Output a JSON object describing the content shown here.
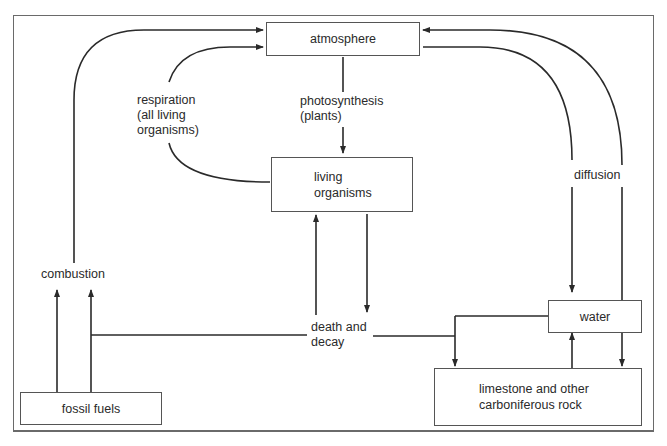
{
  "diagram": {
    "nodes": {
      "atmosphere": "atmosphere",
      "living_organisms": "living\norganisms",
      "water": "water",
      "fossil_fuels": "fossil fuels",
      "limestone": "limestone and other\ncarboniferous rock"
    },
    "process_labels": {
      "respiration": "respiration\n(all living\norganisms)",
      "photosynthesis": "photosynthesis\n(plants)",
      "diffusion": "diffusion",
      "combustion": "combustion",
      "death_decay": "death and\ndecay"
    },
    "edges": [
      {
        "from": "combustion",
        "to": "atmosphere"
      },
      {
        "from": "living organisms",
        "to": "atmosphere",
        "label": "respiration (all living organisms)"
      },
      {
        "from": "atmosphere",
        "to": "living organisms",
        "label": "photosynthesis (plants)"
      },
      {
        "from": "atmosphere",
        "to": "water",
        "label": "diffusion"
      },
      {
        "from": "water",
        "to": "atmosphere",
        "label": "diffusion"
      },
      {
        "from": "fossil fuels",
        "to": "combustion"
      },
      {
        "from": "death and decay",
        "to": "living organisms"
      },
      {
        "from": "living organisms",
        "to": "death and decay"
      },
      {
        "from": "death and decay",
        "to": "fossil fuels"
      },
      {
        "from": "death and decay",
        "to": "limestone and other carboniferous rock"
      },
      {
        "from": "water",
        "to": "limestone and other carboniferous rock"
      },
      {
        "from": "limestone and other carboniferous rock",
        "to": "water"
      }
    ]
  }
}
